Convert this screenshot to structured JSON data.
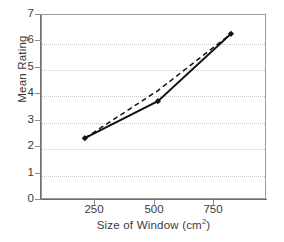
{
  "chart_data": {
    "type": "line",
    "title": "",
    "xlabel": "Size of Window (cm²)",
    "xlabel_main": "Size of Window (cm",
    "xlabel_sup": "2",
    "xlabel_tail": ")",
    "ylabel": "Mean Rating",
    "x": [
      250,
      500,
      750
    ],
    "xlim": [
      100,
      870
    ],
    "ylim": [
      0,
      7
    ],
    "xticks": [
      250,
      500,
      750
    ],
    "xtick_labels": [
      "250",
      "500",
      "750"
    ],
    "yticks": [
      0,
      1,
      2,
      3,
      4,
      5,
      6,
      7
    ],
    "ytick_labels": [
      "0",
      "1",
      "2",
      "3",
      "4",
      "5",
      "6",
      "7"
    ],
    "grid": "horizontal-dotted",
    "gridlines_at": [
      1,
      2,
      3,
      4,
      5,
      6
    ],
    "legend": "none",
    "series": [
      {
        "name": "observed",
        "style": "solid",
        "marker": "filled-diamond",
        "color": "#111111",
        "values": [
          2.3,
          3.7,
          6.25
        ]
      },
      {
        "name": "linear-fit",
        "style": "dashed",
        "marker": "none",
        "color": "#111111",
        "values": [
          2.3,
          4.1,
          6.25
        ]
      }
    ]
  },
  "axes": {
    "frame_color": "#9a9a9a",
    "axis_color": "#6d6d6d",
    "grid_color": "#c9c9c9"
  }
}
